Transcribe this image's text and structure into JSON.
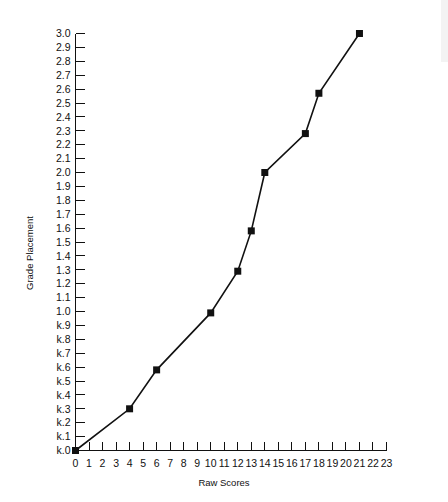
{
  "chart_data": {
    "type": "line",
    "title": "",
    "xlabel": "Raw Scores",
    "ylabel": "Grade Placement",
    "xlim": [
      0,
      23
    ],
    "ylim": [
      0,
      3.0
    ],
    "grid": false,
    "legend": null,
    "marker": "filled-square",
    "line_color": "#111111",
    "x": [
      0,
      4,
      6,
      10,
      12,
      13,
      14,
      17,
      18,
      21
    ],
    "values": [
      0.0,
      0.3,
      0.58,
      0.99,
      1.29,
      1.58,
      2.0,
      2.28,
      2.57,
      3.0
    ],
    "point_labels": [
      "k.0",
      "k.3",
      "k.6",
      "1.0",
      "1.3",
      "1.6",
      "2.0",
      "2.3",
      "2.6",
      "3.0"
    ],
    "xticks": [
      "0",
      "1",
      "2",
      "3",
      "4",
      "5",
      "6",
      "7",
      "8",
      "9",
      "10",
      "11",
      "12",
      "13",
      "14",
      "15",
      "16",
      "17",
      "18",
      "19",
      "20",
      "21",
      "22",
      "23"
    ],
    "yticks": [
      "k.0",
      "k.1",
      "k.2",
      "k.3",
      "k.4",
      "k.5",
      "k.6",
      "k.7",
      "k.8",
      "k.9",
      "1.0",
      "1.1",
      "1.2",
      "1.3",
      "1.4",
      "1.5",
      "1.6",
      "1.7",
      "1.8",
      "1.9",
      "2.0",
      "2.1",
      "2.2",
      "2.3",
      "2.4",
      "2.5",
      "2.6",
      "2.7",
      "2.8",
      "2.9",
      "3.0"
    ],
    "ytick_values": [
      0.0,
      0.1,
      0.2,
      0.3,
      0.4,
      0.5,
      0.6,
      0.7,
      0.8,
      0.9,
      1.0,
      1.1,
      1.2,
      1.3,
      1.4,
      1.5,
      1.6,
      1.7,
      1.8,
      1.9,
      2.0,
      2.1,
      2.2,
      2.3,
      2.4,
      2.5,
      2.6,
      2.7,
      2.8,
      2.9,
      3.0
    ]
  }
}
